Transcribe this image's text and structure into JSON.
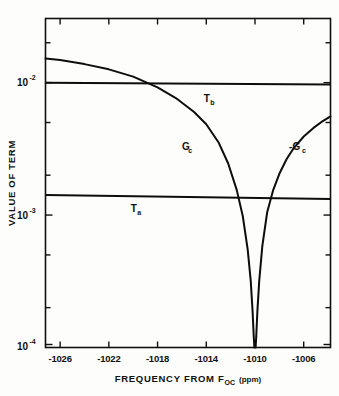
{
  "chart_data": {
    "type": "line",
    "title": "",
    "xlabel": "FREQUENCY FROM F",
    "xlabel_sub": "OC",
    "xlabel_units": "(ppm)",
    "ylabel": "VALUE OF TERM",
    "xlim": [
      -1027.2,
      -1003.8
    ],
    "ylim": [
      0.0001,
      0.0305
    ],
    "yscale": "log",
    "xscale": "linear",
    "grid": false,
    "legend": "none",
    "xticks": [
      -1026,
      -1022,
      -1018,
      -1014,
      -1010,
      -1006
    ],
    "xticklabels": [
      "-1026",
      "-1022",
      "-1018",
      "-1014",
      "-1010",
      "-1006"
    ],
    "yticks": [
      0.01,
      0.001,
      0.0001
    ],
    "yticklabels": [
      "10",
      "10",
      "10"
    ],
    "ytick_exponents": [
      "-2",
      "-3",
      "-4"
    ],
    "yminorticks": [
      0.02,
      0.005,
      0.002,
      0.0005,
      0.0002
    ],
    "series": [
      {
        "name": "T_b",
        "label": "T",
        "label_sub": "b",
        "label_x": -1014.2,
        "label_y": 0.0072,
        "kind": "horizontal-line",
        "value": 0.0099,
        "x": [
          -1027.2,
          -1003.8
        ],
        "y": [
          0.01,
          0.0097
        ]
      },
      {
        "name": "T_a",
        "label": "T",
        "label_sub": "a",
        "label_x": -1020.2,
        "label_y": 0.00105,
        "kind": "horizontal-line",
        "value": 0.00138,
        "x": [
          -1027.2,
          -1003.8
        ],
        "y": [
          0.00142,
          0.00132
        ]
      },
      {
        "name": "G_c",
        "label": "G",
        "label_sub": "c",
        "label_x": -1016.0,
        "label_y": 0.0031,
        "kind": "curve",
        "x": [
          -1027.2,
          -1026.0,
          -1024.0,
          -1022.0,
          -1020.0,
          -1018.0,
          -1016.5,
          -1015.0,
          -1014.0,
          -1013.0,
          -1012.2,
          -1011.5,
          -1011.0,
          -1010.6,
          -1010.35,
          -1010.2,
          -1010.1,
          -1010.05
        ],
        "y": [
          0.0152,
          0.0148,
          0.0138,
          0.0126,
          0.0111,
          0.0092,
          0.00765,
          0.006,
          0.00485,
          0.00355,
          0.00245,
          0.00155,
          0.00098,
          0.00055,
          0.00032,
          0.00019,
          0.00012,
          0.0001
        ]
      },
      {
        "name": "-G_c",
        "label": "-G",
        "label_sub": "c",
        "label_x": -1007.2,
        "label_y": 0.0031,
        "kind": "curve",
        "x": [
          -1009.95,
          -1009.9,
          -1009.8,
          -1009.65,
          -1009.4,
          -1009.0,
          -1008.5,
          -1008.0,
          -1007.4,
          -1006.8,
          -1006.0,
          -1005.2,
          -1004.4,
          -1003.8
        ],
        "y": [
          0.0001,
          0.00012,
          0.00019,
          0.00032,
          0.00058,
          0.00105,
          0.00155,
          0.00205,
          0.00265,
          0.00322,
          0.00392,
          0.00455,
          0.00515,
          0.00556
        ]
      }
    ],
    "annotations": []
  }
}
